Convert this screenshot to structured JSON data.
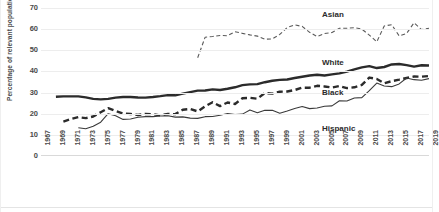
{
  "chart_data": {
    "type": "line",
    "title": "",
    "xlabel": "",
    "ylabel": "Percentage of relevant population",
    "ylim": [
      0,
      70
    ],
    "ytick_step": 10,
    "yticks": [
      "0",
      "10",
      "20",
      "30",
      "40",
      "50",
      "60",
      "70"
    ],
    "grid": true,
    "grid_axis": "y",
    "legend_position": "inline-labels",
    "xlim": [
      1967,
      2019
    ],
    "xtick_step": 2,
    "xticks": [
      "1967",
      "1969",
      "1971",
      "1973",
      "1975",
      "1977",
      "1979",
      "1981",
      "1983",
      "1985",
      "1987",
      "1989",
      "1991",
      "1993",
      "1995",
      "1997",
      "1999",
      "2001",
      "2003",
      "2005",
      "2007",
      "2009",
      "2011",
      "2013",
      "2015",
      "2017",
      "2019"
    ],
    "series": [
      {
        "name": "White",
        "label": "White",
        "style": "solid",
        "width": 2.4,
        "color": "#2b2b2b",
        "x": [
          1969,
          1970,
          1971,
          1972,
          1973,
          1974,
          1975,
          1976,
          1977,
          1978,
          1979,
          1980,
          1981,
          1982,
          1983,
          1984,
          1985,
          1986,
          1987,
          1988,
          1989,
          1990,
          1991,
          1992,
          1993,
          1994,
          1995,
          1996,
          1997,
          1998,
          1999,
          2000,
          2001,
          2002,
          2003,
          2004,
          2005,
          2006,
          2007,
          2008,
          2009,
          2010,
          2011,
          2012,
          2013,
          2014,
          2015,
          2016,
          2017,
          2018,
          2019
        ],
        "values": [
          28.0,
          28.2,
          28.2,
          28.2,
          27.7,
          27.0,
          26.8,
          27.0,
          27.6,
          27.9,
          27.9,
          27.7,
          27.6,
          27.9,
          28.3,
          28.8,
          28.7,
          29.5,
          30.2,
          30.9,
          31.0,
          31.5,
          31.2,
          31.8,
          32.5,
          33.5,
          33.9,
          34.0,
          34.9,
          35.6,
          36.0,
          36.2,
          36.9,
          37.5,
          38.1,
          38.4,
          38.1,
          38.6,
          39.1,
          39.9,
          41.0,
          41.9,
          42.5,
          41.6,
          42.1,
          43.3,
          43.5,
          43.0,
          42.3,
          42.9,
          42.8
        ]
      },
      {
        "name": "Black",
        "label": "Black",
        "style": "dashed",
        "width": 2.4,
        "color": "#2b2b2b",
        "x": [
          1970,
          1971,
          1972,
          1973,
          1974,
          1975,
          1976,
          1977,
          1978,
          1979,
          1980,
          1981,
          1982,
          1983,
          1984,
          1985,
          1986,
          1987,
          1988,
          1989,
          1990,
          1991,
          1992,
          1993,
          1994,
          1995,
          1996,
          1997,
          1998,
          1999,
          2000,
          2001,
          2002,
          2003,
          2004,
          2005,
          2006,
          2007,
          2008,
          2009,
          2010,
          2011,
          2012,
          2013,
          2014,
          2015,
          2016,
          2017,
          2018,
          2019
        ],
        "values": [
          16.3,
          17.5,
          18.4,
          17.9,
          18.7,
          20.7,
          22.6,
          21.3,
          20.1,
          19.9,
          19.4,
          19.9,
          19.8,
          19.2,
          19.9,
          19.8,
          21.9,
          22.2,
          21.1,
          23.5,
          25.4,
          23.6,
          25.3,
          24.6,
          27.3,
          27.5,
          27.1,
          29.8,
          29.5,
          30.4,
          30.5,
          31.2,
          32.3,
          32.3,
          33.2,
          32.9,
          32.4,
          33.1,
          32.1,
          32.5,
          33.6,
          37.1,
          36.4,
          34.4,
          35.4,
          36.1,
          36.9,
          37.6,
          37.5,
          37.8
        ]
      },
      {
        "name": "Hispanic",
        "label": "Hispanic",
        "style": "solid",
        "width": 1.1,
        "color": "#3a3a3a",
        "x": [
          1972,
          1973,
          1974,
          1975,
          1976,
          1977,
          1978,
          1979,
          1980,
          1981,
          1982,
          1983,
          1984,
          1985,
          1986,
          1987,
          1988,
          1989,
          1990,
          1991,
          1992,
          1993,
          1994,
          1995,
          1996,
          1997,
          1998,
          1999,
          2000,
          2001,
          2002,
          2003,
          2004,
          2005,
          2006,
          2007,
          2008,
          2009,
          2010,
          2011,
          2012,
          2013,
          2014,
          2015,
          2016,
          2017,
          2018,
          2019
        ],
        "values": [
          13.4,
          12.9,
          14.1,
          16.0,
          20.0,
          19.0,
          17.3,
          17.5,
          18.3,
          18.6,
          18.6,
          18.9,
          19.0,
          18.4,
          18.5,
          17.9,
          17.8,
          18.6,
          18.7,
          19.3,
          20.1,
          19.6,
          19.8,
          21.8,
          20.5,
          21.6,
          21.6,
          20.2,
          21.3,
          22.5,
          23.4,
          22.4,
          22.7,
          23.5,
          23.7,
          26.1,
          26.0,
          27.4,
          27.6,
          30.9,
          34.5,
          33.1,
          32.8,
          34.1,
          36.9,
          36.1,
          35.8,
          36.6
        ]
      },
      {
        "name": "Asian",
        "label": "Asian",
        "style": "dashed",
        "width": 1.1,
        "color": "#5a5a5a",
        "x": [
          1988,
          1989,
          1990,
          1991,
          1992,
          1993,
          1994,
          1995,
          1996,
          1997,
          1998,
          1999,
          2000,
          2001,
          2002,
          2003,
          2004,
          2005,
          2006,
          2007,
          2008,
          2009,
          2010,
          2011,
          2012,
          2013,
          2014,
          2015,
          2016,
          2017,
          2018,
          2019
        ],
        "values": [
          46.5,
          56.2,
          56.5,
          57.0,
          56.9,
          58.8,
          58.0,
          57.3,
          56.7,
          55.2,
          55.4,
          57.5,
          60.8,
          62.0,
          61.3,
          58.5,
          56.5,
          57.9,
          58.4,
          60.4,
          60.4,
          60.7,
          60.0,
          57.2,
          54.0,
          61.5,
          62.1,
          56.8,
          58.0,
          63.0,
          59.8,
          60.4
        ]
      }
    ]
  }
}
